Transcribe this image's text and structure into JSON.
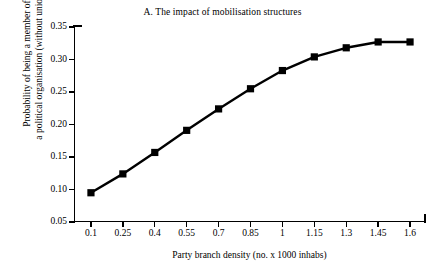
{
  "chart_data": {
    "type": "line",
    "title": "A. The impact of mobilisation structures",
    "xlabel": "Party branch density (no. x 1000 inhabs)",
    "ylabel_lines": [
      "Probability of being a member of",
      "a political organisation (without unions)"
    ],
    "ylabel": "Probability of being a member of a political organisation (without unions)",
    "x": [
      0.1,
      0.25,
      0.4,
      0.55,
      0.7,
      0.85,
      1,
      1.15,
      1.3,
      1.45,
      1.6
    ],
    "xtick_labels": [
      "0.1",
      "0.25",
      "0.4",
      "0.55",
      "0.7",
      "0.85",
      "1",
      "1.15",
      "1.3",
      "1.45",
      "1.6"
    ],
    "values": [
      0.095,
      0.124,
      0.157,
      0.191,
      0.224,
      0.255,
      0.283,
      0.304,
      0.318,
      0.327,
      0.327
    ],
    "ytick_labels": [
      "0.35",
      "0.30",
      "0.25",
      "0.20",
      "0.15",
      "0.10",
      "0.05"
    ],
    "yticks": [
      0.35,
      0.3,
      0.25,
      0.2,
      0.15,
      0.1,
      0.05
    ],
    "ylim": [
      0.05,
      0.35
    ],
    "xlim": [
      0.025,
      1.675
    ],
    "grid": false,
    "legend": false,
    "series_color": "#000000",
    "marker": "square",
    "background": "#ffffff"
  }
}
